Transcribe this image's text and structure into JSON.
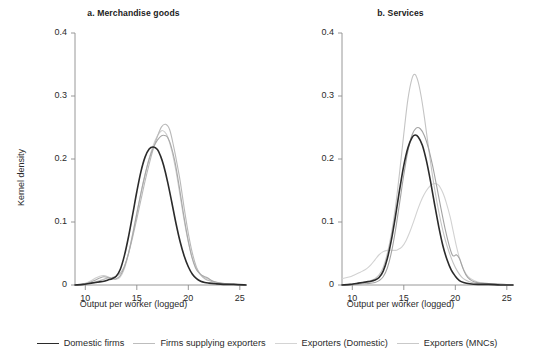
{
  "chart_data": {
    "type": "line",
    "title": "",
    "xlabel": "Output per worker (logged)",
    "ylabel": "Kernel density",
    "xlim": [
      9,
      25.6
    ],
    "ylim": [
      0,
      0.4
    ],
    "xticks": [
      10,
      15,
      20,
      25
    ],
    "xtick_labels": [
      "10",
      "15",
      "20",
      "25"
    ],
    "yticks": [
      0,
      0.1,
      0.2,
      0.3,
      0.4
    ],
    "ytick_labels": [
      "0",
      "0.1",
      "0.2",
      "0.3",
      "0.4"
    ],
    "grid": false,
    "legend_position": "bottom",
    "panels": [
      {
        "key": "a",
        "label": "a. Merchandise goods",
        "series": [
          {
            "name": "Domestic firms",
            "color": "#2b2b2b",
            "width": 1.6,
            "x": [
              9.0,
              9.8,
              10.2,
              10.6,
              11.0,
              11.4,
              11.8,
              12.2,
              12.6,
              13.0,
              13.4,
              13.8,
              14.2,
              14.6,
              15.0,
              15.4,
              15.8,
              16.2,
              16.6,
              17.0,
              17.3,
              17.6,
              18.0,
              18.4,
              18.8,
              19.2,
              19.6,
              20.0,
              20.4,
              20.8,
              21.2,
              21.6,
              22.0,
              22.6,
              23.4,
              24.4,
              25.6
            ],
            "y": [
              0.0,
              0.001,
              0.002,
              0.003,
              0.004,
              0.005,
              0.006,
              0.008,
              0.01,
              0.014,
              0.025,
              0.047,
              0.077,
              0.112,
              0.148,
              0.18,
              0.203,
              0.216,
              0.219,
              0.215,
              0.205,
              0.19,
              0.163,
              0.131,
              0.098,
              0.069,
              0.046,
              0.029,
              0.017,
              0.01,
              0.006,
              0.004,
              0.003,
              0.002,
              0.001,
              0.001,
              0.0
            ]
          },
          {
            "name": "Firms supplying exporters",
            "color": "#b9b9b9",
            "width": 1.1,
            "x": [
              9.0,
              9.8,
              10.2,
              10.6,
              11.0,
              11.4,
              11.8,
              12.2,
              12.6,
              13.0,
              13.4,
              13.8,
              14.2,
              14.6,
              15.0,
              15.4,
              15.8,
              16.2,
              16.6,
              17.0,
              17.4,
              17.8,
              18.2,
              18.6,
              18.9,
              19.2,
              19.6,
              20.0,
              20.4,
              20.8,
              21.2,
              21.6,
              22.0,
              22.6,
              23.4,
              24.4,
              25.6
            ],
            "y": [
              0.0,
              0.001,
              0.002,
              0.004,
              0.005,
              0.007,
              0.009,
              0.011,
              0.012,
              0.014,
              0.019,
              0.03,
              0.05,
              0.076,
              0.105,
              0.135,
              0.165,
              0.192,
              0.216,
              0.236,
              0.251,
              0.255,
              0.246,
              0.218,
              0.193,
              0.166,
              0.122,
              0.082,
              0.05,
              0.028,
              0.016,
              0.01,
              0.007,
              0.004,
              0.002,
              0.001,
              0.0
            ]
          },
          {
            "name": "Exporters (Domestic)",
            "color": "#cfcfcf",
            "width": 1.1,
            "x": [
              9.0,
              9.8,
              10.2,
              10.6,
              11.0,
              11.4,
              11.8,
              12.2,
              12.6,
              13.0,
              13.4,
              13.8,
              14.2,
              14.6,
              15.0,
              15.4,
              15.8,
              16.2,
              16.6,
              17.0,
              17.4,
              17.7,
              18.0,
              18.4,
              18.8,
              19.2,
              19.6,
              20.0,
              20.4,
              20.8,
              21.2,
              21.6,
              22.0,
              22.6,
              23.4,
              24.4,
              25.6
            ],
            "y": [
              0.0,
              0.002,
              0.004,
              0.007,
              0.011,
              0.014,
              0.015,
              0.013,
              0.01,
              0.009,
              0.013,
              0.026,
              0.05,
              0.082,
              0.115,
              0.146,
              0.175,
              0.201,
              0.222,
              0.237,
              0.245,
              0.243,
              0.235,
              0.213,
              0.181,
              0.142,
              0.102,
              0.068,
              0.042,
              0.026,
              0.017,
              0.012,
              0.009,
              0.005,
              0.002,
              0.001,
              0.0
            ]
          },
          {
            "name": "Exporters (MNCs)",
            "color": "#a8a8a8",
            "width": 1.1,
            "x": [
              9.0,
              9.8,
              10.2,
              10.6,
              11.0,
              11.4,
              11.8,
              12.2,
              12.6,
              13.0,
              13.4,
              13.8,
              14.2,
              14.6,
              15.0,
              15.4,
              15.8,
              16.2,
              16.6,
              17.0,
              17.4,
              17.8,
              18.0,
              18.3,
              18.7,
              19.1,
              19.5,
              19.9,
              20.3,
              20.7,
              21.1,
              21.5,
              21.9,
              22.4,
              23.2,
              24.2,
              25.6
            ],
            "y": [
              0.0,
              0.001,
              0.003,
              0.005,
              0.008,
              0.011,
              0.013,
              0.012,
              0.01,
              0.01,
              0.015,
              0.029,
              0.051,
              0.08,
              0.113,
              0.146,
              0.175,
              0.2,
              0.218,
              0.23,
              0.237,
              0.237,
              0.234,
              0.222,
              0.196,
              0.158,
              0.116,
              0.078,
              0.047,
              0.027,
              0.018,
              0.014,
              0.011,
              0.006,
              0.003,
              0.001,
              0.0
            ]
          }
        ]
      },
      {
        "key": "b",
        "label": "b. Services",
        "series": [
          {
            "name": "Domestic firms",
            "color": "#2b2b2b",
            "width": 1.6,
            "x": [
              9.0,
              9.8,
              10.2,
              10.6,
              11.0,
              11.4,
              11.8,
              12.2,
              12.6,
              13.0,
              13.4,
              13.8,
              14.2,
              14.6,
              15.0,
              15.4,
              15.8,
              16.1,
              16.4,
              16.8,
              17.2,
              17.6,
              18.0,
              18.4,
              18.8,
              19.2,
              19.6,
              20.0,
              20.4,
              20.8,
              21.4,
              22.2,
              23.2,
              24.4,
              25.6
            ],
            "y": [
              0.0,
              0.001,
              0.002,
              0.003,
              0.004,
              0.005,
              0.006,
              0.008,
              0.012,
              0.022,
              0.042,
              0.072,
              0.11,
              0.152,
              0.19,
              0.218,
              0.234,
              0.238,
              0.235,
              0.222,
              0.197,
              0.164,
              0.127,
              0.092,
              0.062,
              0.04,
              0.024,
              0.014,
              0.007,
              0.004,
              0.002,
              0.001,
              0.001,
              0.0,
              0.0
            ]
          },
          {
            "name": "Firms supplying exporters",
            "color": "#c4c4c4",
            "width": 1.1,
            "x": [
              9.0,
              9.8,
              10.2,
              10.6,
              11.0,
              11.4,
              11.8,
              12.2,
              12.6,
              13.0,
              13.4,
              13.8,
              14.2,
              14.6,
              15.0,
              15.4,
              15.8,
              16.1,
              16.4,
              16.7,
              17.0,
              17.4,
              17.8,
              18.2,
              18.6,
              19.0,
              19.4,
              19.8,
              20.2,
              20.6,
              21.0,
              21.6,
              22.4,
              23.4,
              24.4,
              25.6
            ],
            "y": [
              0.0,
              0.001,
              0.002,
              0.003,
              0.004,
              0.005,
              0.007,
              0.01,
              0.016,
              0.028,
              0.05,
              0.082,
              0.125,
              0.18,
              0.24,
              0.295,
              0.328,
              0.334,
              0.322,
              0.298,
              0.266,
              0.218,
              0.172,
              0.133,
              0.1,
              0.073,
              0.052,
              0.035,
              0.022,
              0.013,
              0.008,
              0.004,
              0.002,
              0.001,
              0.0,
              0.0
            ]
          },
          {
            "name": "Exporters (Domestic)",
            "color": "#d2d2d2",
            "width": 1.1,
            "x": [
              9.0,
              9.8,
              10.2,
              10.6,
              11.0,
              11.4,
              11.8,
              12.2,
              12.6,
              13.0,
              13.4,
              13.8,
              14.2,
              14.4,
              14.8,
              15.2,
              15.6,
              16.0,
              16.4,
              16.8,
              17.2,
              17.6,
              18.0,
              18.4,
              18.8,
              19.1,
              19.5,
              19.8,
              20.1,
              20.4,
              20.8,
              21.2,
              21.8,
              22.6,
              23.6,
              24.6,
              25.6
            ],
            "y": [
              0.01,
              0.013,
              0.016,
              0.019,
              0.022,
              0.026,
              0.032,
              0.04,
              0.048,
              0.053,
              0.055,
              0.055,
              0.055,
              0.056,
              0.06,
              0.07,
              0.085,
              0.103,
              0.122,
              0.138,
              0.15,
              0.158,
              0.161,
              0.158,
              0.146,
              0.132,
              0.108,
              0.085,
              0.062,
              0.043,
              0.025,
              0.014,
              0.007,
              0.003,
              0.002,
              0.001,
              0.0
            ]
          },
          {
            "name": "Exporters (MNCs)",
            "color": "#a3a3a3",
            "width": 1.1,
            "x": [
              9.0,
              9.8,
              10.2,
              10.6,
              11.0,
              11.4,
              11.8,
              12.2,
              12.6,
              13.0,
              13.4,
              13.8,
              14.2,
              14.6,
              15.0,
              15.4,
              15.8,
              16.2,
              16.6,
              17.0,
              17.4,
              17.8,
              18.2,
              18.6,
              19.0,
              19.4,
              19.7,
              19.9,
              20.1,
              20.4,
              20.8,
              21.2,
              21.8,
              22.6,
              23.6,
              24.6,
              25.6
            ],
            "y": [
              0.0,
              0.0,
              0.001,
              0.001,
              0.002,
              0.002,
              0.003,
              0.004,
              0.007,
              0.013,
              0.027,
              0.052,
              0.088,
              0.131,
              0.175,
              0.213,
              0.238,
              0.249,
              0.248,
              0.237,
              0.217,
              0.189,
              0.156,
              0.122,
              0.09,
              0.063,
              0.048,
              0.046,
              0.048,
              0.042,
              0.024,
              0.012,
              0.005,
              0.003,
              0.002,
              0.001,
              0.0
            ]
          }
        ]
      }
    ],
    "legend": [
      {
        "label": "Domestic firms",
        "color": "#2b2b2b",
        "width": 1.7
      },
      {
        "label": "Firms supplying exporters",
        "color": "#bdbdbd",
        "width": 1.2
      },
      {
        "label": "Exporters (Domestic)",
        "color": "#d4d4d4",
        "width": 1.2
      },
      {
        "label": "Exporters (MNCs)",
        "color": "#c9c9c9",
        "width": 1.2
      }
    ]
  },
  "axis": {
    "color": "#8c8c8c"
  }
}
